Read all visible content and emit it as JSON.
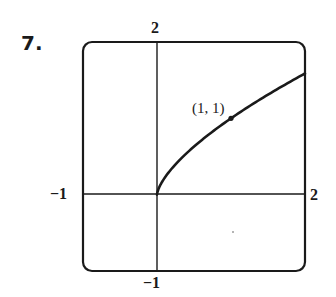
{
  "problem": {
    "number_label": "7."
  },
  "chart_data": {
    "type": "line",
    "title": "",
    "xlabel": "",
    "ylabel": "",
    "xlim": [
      -1,
      2
    ],
    "ylim": [
      -1,
      2
    ],
    "grid": false,
    "legend": null,
    "tick_labels": {
      "x_min": "−1",
      "x_max": "2",
      "y_min": "−1",
      "y_max": "2"
    },
    "series": [
      {
        "name": "y = x^(2/3), x ≥ 0",
        "x": [
          0,
          0.05,
          0.1,
          0.25,
          0.5,
          0.75,
          1,
          1.25,
          1.5,
          1.75,
          2
        ],
        "y": [
          0,
          0.136,
          0.215,
          0.397,
          0.63,
          0.825,
          1,
          1.16,
          1.31,
          1.452,
          1.587
        ]
      }
    ],
    "annotations": [
      {
        "text": "(1, 1)",
        "x": 1,
        "y": 1,
        "marker": "dot"
      }
    ],
    "axes": {
      "x_axis_at_y": 0,
      "y_axis_at_x": 0
    },
    "frame": "rounded-rectangle viewing window"
  },
  "labels": {
    "top": "2",
    "bottom": "−1",
    "left": "−1",
    "right": "2",
    "point": "(1, 1)"
  }
}
